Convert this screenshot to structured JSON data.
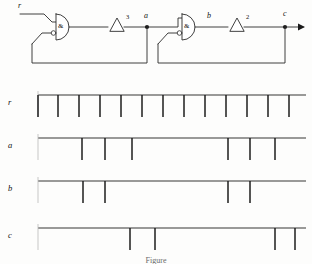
{
  "figure": {
    "kind": "digital-logic-circuit-with-timing-diagram",
    "caption": "Figure"
  },
  "circuit": {
    "signal_labels": {
      "input": "r",
      "node_a": "a",
      "node_b": "b",
      "output": "c"
    },
    "gates": [
      {
        "id": "gate1",
        "type": "and-gate",
        "letter": "&",
        "inverted_input": true
      },
      {
        "id": "gate2",
        "type": "and-gate",
        "letter": "&",
        "inverted_input": true
      }
    ],
    "delays": [
      {
        "id": "delay1",
        "symbol": "Δ",
        "exponent": "3"
      },
      {
        "id": "delay2",
        "symbol": "Δ",
        "exponent": "2"
      }
    ],
    "colors": {
      "wire": "#2b2b2b",
      "ink": "#111111",
      "paper": "#fdfdfc"
    }
  },
  "timing": {
    "axis": {
      "x_start": 38,
      "x_end": 306,
      "pulse_height": 22,
      "baseline_color": "#2b2b2b"
    },
    "rows": [
      {
        "label": "r",
        "name": "waveform-row-r",
        "baseline_y": 95,
        "pulses": [
          38,
          58,
          79,
          100,
          121,
          142,
          163,
          184,
          205,
          226,
          247,
          268,
          289
        ]
      },
      {
        "label": "a",
        "name": "waveform-row-a",
        "baseline_y": 138,
        "pulses": [
          82,
          105,
          132,
          228,
          250,
          275
        ]
      },
      {
        "label": "b",
        "name": "waveform-row-b",
        "baseline_y": 181,
        "pulses": [
          83,
          105,
          228,
          250
        ]
      },
      {
        "label": "c",
        "name": "waveform-row-c",
        "baseline_y": 228,
        "pulses": [
          130,
          155,
          275,
          295
        ]
      }
    ]
  },
  "chart_data": {
    "type": "line",
    "xlabel": "time",
    "ylabel": "signal",
    "grid": false,
    "legend": "row-labels-left",
    "series": [
      {
        "name": "r",
        "description": "clock / reference pulse train",
        "pulse_times": [
          0,
          1,
          2,
          3,
          4,
          5,
          6,
          7,
          8,
          9,
          10,
          11,
          12
        ]
      },
      {
        "name": "a",
        "description": "output of first AND gate via delay 3",
        "pulse_times": [
          2,
          3,
          4,
          9,
          10,
          11
        ]
      },
      {
        "name": "b",
        "description": "output of second AND gate input",
        "pulse_times": [
          2,
          3,
          9,
          10
        ]
      },
      {
        "name": "c",
        "description": "final output via delay 2",
        "pulse_times": [
          4,
          5,
          11,
          12
        ]
      }
    ]
  }
}
